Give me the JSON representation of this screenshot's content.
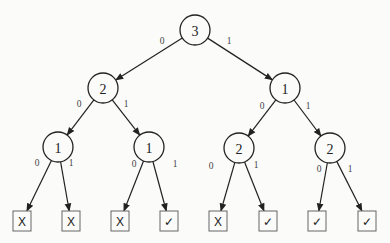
{
  "tree": {
    "nodes": [
      {
        "id": "n0",
        "label": "3",
        "x": 195,
        "y": 30
      },
      {
        "id": "n1",
        "label": "2",
        "x": 103,
        "y": 88
      },
      {
        "id": "n2",
        "label": "1",
        "x": 285,
        "y": 88
      },
      {
        "id": "n3",
        "label": "1",
        "x": 58,
        "y": 147
      },
      {
        "id": "n4",
        "label": "1",
        "x": 149,
        "y": 147
      },
      {
        "id": "n5",
        "label": "2",
        "x": 239,
        "y": 148
      },
      {
        "id": "n6",
        "label": "2",
        "x": 330,
        "y": 148
      }
    ],
    "leaves": [
      {
        "id": "l0",
        "label": "X",
        "x": 22,
        "y": 221
      },
      {
        "id": "l1",
        "label": "X",
        "x": 71,
        "y": 221
      },
      {
        "id": "l2",
        "label": "X",
        "x": 120,
        "y": 221
      },
      {
        "id": "l3",
        "label": "✓",
        "x": 169,
        "y": 221
      },
      {
        "id": "l4",
        "label": "X",
        "x": 218,
        "y": 221
      },
      {
        "id": "l5",
        "label": "✓",
        "x": 268,
        "y": 221
      },
      {
        "id": "l6",
        "label": "✓",
        "x": 317,
        "y": 221
      },
      {
        "id": "l7",
        "label": "✓",
        "x": 367,
        "y": 221
      }
    ],
    "edges": [
      {
        "from": "n0",
        "to": "n1",
        "label": "0",
        "lx": 162,
        "ly": 41
      },
      {
        "from": "n0",
        "to": "n2",
        "label": "1",
        "lx": 229,
        "ly": 41
      },
      {
        "from": "n1",
        "to": "n3",
        "label": "0",
        "lx": 79,
        "ly": 104
      },
      {
        "from": "n1",
        "to": "n4",
        "label": "1",
        "lx": 126,
        "ly": 104
      },
      {
        "from": "n2",
        "to": "n5",
        "label": "0",
        "lx": 262,
        "ly": 106
      },
      {
        "from": "n2",
        "to": "n6",
        "label": "1",
        "lx": 308,
        "ly": 106
      },
      {
        "from": "n3",
        "to": "l0",
        "label": "0",
        "lx": 37,
        "ly": 163
      },
      {
        "from": "n3",
        "to": "l1",
        "label": "1",
        "lx": 71,
        "ly": 163
      },
      {
        "from": "n4",
        "to": "l2",
        "label": "0",
        "lx": 134,
        "ly": 164
      },
      {
        "from": "n4",
        "to": "l3",
        "label": "1",
        "lx": 175,
        "ly": 164
      },
      {
        "from": "n5",
        "to": "l4",
        "label": "0",
        "lx": 211,
        "ly": 166
      },
      {
        "from": "n5",
        "to": "l5",
        "label": "1",
        "lx": 256,
        "ly": 165
      },
      {
        "from": "n6",
        "to": "l6",
        "label": "0",
        "lx": 319,
        "ly": 169
      },
      {
        "from": "n6",
        "to": "l7",
        "label": "1",
        "lx": 350,
        "ly": 169
      }
    ]
  }
}
